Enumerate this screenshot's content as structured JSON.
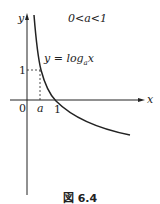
{
  "figure": {
    "condition": "0<a<1",
    "function_label": "y = log",
    "function_sub": "a",
    "function_var": "x",
    "axis_x_label": "x",
    "axis_y_label": "y",
    "origin_label": "0",
    "tick_a_label": "a",
    "tick_1_x_label": "1",
    "tick_1_y_label": "1",
    "caption": "図 6.4",
    "colors": {
      "line": "#222222",
      "background": "#ffffff"
    }
  }
}
